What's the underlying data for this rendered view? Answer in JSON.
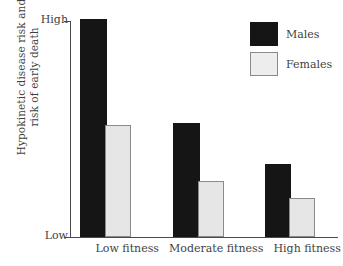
{
  "chart_data": {
    "type": "bar",
    "title": "",
    "xlabel": "",
    "ylabel_line1": "Hypokinetic disease risk and",
    "ylabel_line2": "risk of early death",
    "categories": [
      "Low fitness",
      "Moderate fitness",
      "High fitness"
    ],
    "series": [
      {
        "name": "Males",
        "color": "#151515",
        "values": [
          100,
          52,
          33
        ]
      },
      {
        "name": "Females",
        "color": "#e6e6e6",
        "values": [
          51,
          25,
          17
        ]
      }
    ],
    "ylim": [
      0,
      100
    ],
    "y_tick_labels": [
      "Low",
      "High"
    ],
    "y_tick_low": "Low",
    "y_tick_high": "High",
    "grid": false,
    "legend_position": "top-right",
    "legend_entries": [
      "Males",
      "Females"
    ]
  },
  "axis": {
    "y_high_label": "High",
    "y_low_label": "Low",
    "y_title_line1": "Hypokinetic disease risk and",
    "y_title_line2": "risk of early death",
    "x_labels": [
      "Low fitness",
      "Moderate fitness",
      "High fitness"
    ]
  },
  "legend": {
    "items": [
      {
        "label": "Males",
        "swatch": "legend-swatch-males"
      },
      {
        "label": "Females",
        "swatch": "legend-swatch-females"
      }
    ]
  },
  "colors": {
    "males": "#151515",
    "females": "#e6e6e6",
    "females_border": "#8a8a8a",
    "axis": "#4a4a4a",
    "text": "#3f3f3f",
    "background": "#ffffff"
  }
}
